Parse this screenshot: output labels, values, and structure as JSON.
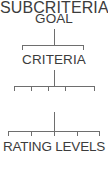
{
  "diagram": {
    "type": "hierarchy-tree",
    "background_color": "#ffffff",
    "line_color": "#6e6e6e",
    "text_color": "#3c3c3c",
    "levels": [
      {
        "id": "goal",
        "label": "GOAL",
        "depth": 0,
        "branch_count": 2,
        "tick_positions": [
          22,
          84
        ]
      },
      {
        "id": "criteria",
        "label": "CRITERIA",
        "depth": 1,
        "branch_count": 5,
        "tick_positions": [
          14,
          31,
          48,
          65,
          95
        ]
      },
      {
        "id": "subcriteria",
        "label": "SUBCRITERIA",
        "depth": 2,
        "branch_count": 5,
        "tick_positions": [
          8,
          31,
          54,
          77,
          100
        ]
      },
      {
        "id": "rating_levels",
        "label": "RATING LEVELS",
        "depth": 3,
        "branch_count": 0,
        "tick_positions": []
      }
    ]
  }
}
